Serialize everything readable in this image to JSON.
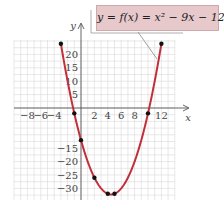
{
  "chart_data": {
    "type": "line",
    "title": "y = f(x) = x² − 9x − 12",
    "equation_label": "y = f(x) = x² − 9x − 12",
    "xlabel": "x",
    "ylabel": "y",
    "xlim": [
      -10,
      14
    ],
    "ylim": [
      -34,
      26
    ],
    "x_tick_labels": [
      "−8",
      "−6",
      "−4",
      "2",
      "4",
      "6",
      "8",
      "12"
    ],
    "x_ticks": [
      -8,
      -6,
      -4,
      2,
      4,
      6,
      8,
      12
    ],
    "y_tick_labels": [
      "20",
      "15",
      "10",
      "5",
      "−15",
      "−20",
      "−25",
      "−30"
    ],
    "y_ticks": [
      20,
      15,
      10,
      5,
      -15,
      -20,
      -25,
      -30
    ],
    "grid": true,
    "series": [
      {
        "name": "f(x) = x² − 9x − 12",
        "color": "#c0303a",
        "points": [
          {
            "x": -3,
            "y": 24
          },
          {
            "x": -1,
            "y": -2
          },
          {
            "x": 0,
            "y": -12
          },
          {
            "x": 2,
            "y": -26
          },
          {
            "x": 4,
            "y": -32
          },
          {
            "x": 5,
            "y": -32
          },
          {
            "x": 10,
            "y": -2
          },
          {
            "x": 12,
            "y": 24
          }
        ]
      }
    ]
  },
  "colors": {
    "curve": "#c0303a",
    "label_box": "#e7c9cc",
    "grid": "#d8d8d8",
    "axis": "#555555"
  }
}
